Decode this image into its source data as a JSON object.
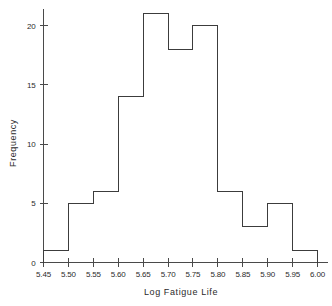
{
  "chart_data": {
    "type": "bar",
    "title": "",
    "subtitle": "",
    "xlabel": "Log Fatigue Life",
    "ylabel": "Frequency",
    "histogram": true,
    "bin_edges": [
      5.45,
      5.5,
      5.55,
      5.6,
      5.65,
      5.7,
      5.75,
      5.8,
      5.85,
      5.9,
      5.95,
      6.0
    ],
    "bin_width": 0.05,
    "categories": [
      "5.45-5.50",
      "5.50-5.55",
      "5.55-5.60",
      "5.60-5.65",
      "5.65-5.70",
      "5.70-5.75",
      "5.75-5.80",
      "5.80-5.85",
      "5.85-5.90",
      "5.90-5.95",
      "5.95-6.00"
    ],
    "values": [
      1,
      5,
      6,
      14,
      21,
      18,
      20,
      6,
      3,
      5,
      1
    ],
    "total_count": 100,
    "xlim": [
      5.45,
      6.0
    ],
    "ylim": [
      0,
      21.5
    ],
    "xticks": [
      5.45,
      5.5,
      5.55,
      5.6,
      5.65,
      5.7,
      5.75,
      5.8,
      5.85,
      5.9,
      5.95,
      6.0
    ],
    "xtick_labels": [
      "5.45",
      "5.50",
      "5.55",
      "5.60",
      "5.65",
      "5.70",
      "5.75",
      "5.80",
      "5.85",
      "5.90",
      "5.95",
      "6.00"
    ],
    "yticks": [
      0,
      5,
      10,
      15,
      20
    ],
    "ytick_labels": [
      "0",
      "5",
      "10",
      "15",
      "20"
    ],
    "grid": false,
    "legend": null,
    "legend_position": "none",
    "annotations": [],
    "colors": {
      "background": "#ffffff",
      "axis": "#4a4a4a",
      "bar_outline": "#3c3c3c",
      "text": "#2b2b2b"
    }
  }
}
